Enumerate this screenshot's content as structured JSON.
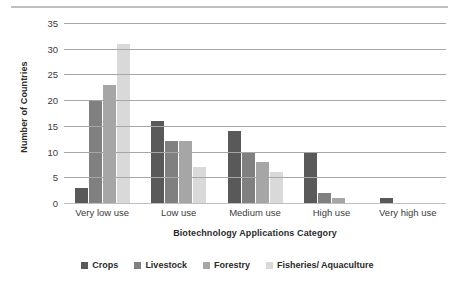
{
  "chart_data": {
    "type": "bar",
    "title": "",
    "xlabel": "Biotechnology Applications Category",
    "ylabel": "Number of Countries",
    "categories": [
      "Very low use",
      "Low use",
      "Medium use",
      "High use",
      "Very high use"
    ],
    "series": [
      {
        "name": "Crops",
        "color": "#595959",
        "values": [
          3,
          16,
          14,
          10,
          1
        ]
      },
      {
        "name": "Livestock",
        "color": "#808080",
        "values": [
          20,
          12,
          10,
          2,
          0
        ]
      },
      {
        "name": "Forestry",
        "color": "#a6a6a6",
        "values": [
          23,
          12,
          8,
          1,
          0
        ]
      },
      {
        "name": "Fisheries/ Aquaculture",
        "color": "#d9d9d9",
        "values": [
          31,
          7,
          6,
          0,
          0
        ]
      }
    ],
    "ylim": [
      0,
      35
    ],
    "yticks": [
      0,
      5,
      10,
      15,
      20,
      25,
      30,
      35
    ],
    "ytick_labels": [
      "0",
      "5",
      "10",
      "15",
      "20",
      "25",
      "30",
      "35"
    ],
    "grid": true,
    "legend_position": "bottom"
  }
}
